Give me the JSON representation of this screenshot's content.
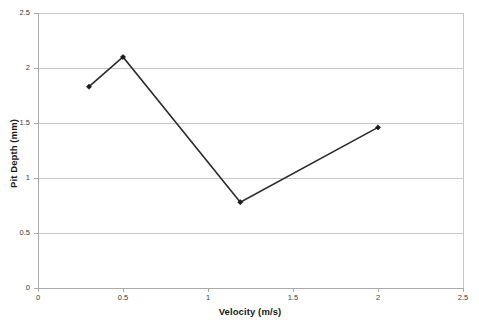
{
  "chart_data": {
    "type": "line",
    "title": "",
    "xlabel": "Velocity (m/s)",
    "ylabel": "Pit Depth (mm)",
    "xlim": [
      0,
      2.5
    ],
    "ylim": [
      0,
      2.5
    ],
    "xticks": [
      "0",
      "0.5",
      "1",
      "1.5",
      "2",
      "2.5"
    ],
    "xtick_values": [
      0,
      0.5,
      1,
      1.5,
      2,
      2.5
    ],
    "yticks": [
      "0",
      "0.5",
      "1",
      "1.5",
      "2",
      "2.5"
    ],
    "ytick_values": [
      0,
      0.5,
      1,
      1.5,
      2,
      2.5
    ],
    "grid": "horizontal",
    "legend": "none",
    "series": [
      {
        "name": "Pit Depth",
        "color": "#2b2b2b",
        "marker": "diamond",
        "x": [
          0.3,
          0.5,
          1.19,
          2.0
        ],
        "y": [
          1.83,
          2.1,
          0.78,
          1.46
        ],
        "points": [
          {
            "x": 0.3,
            "y": 1.83
          },
          {
            "x": 0.5,
            "y": 2.1
          },
          {
            "x": 1.19,
            "y": 0.78
          },
          {
            "x": 2.0,
            "y": 1.46
          }
        ]
      }
    ],
    "colors": {
      "line": "#2b2b2b",
      "marker": "#1a1a1a",
      "gridline": "#c8c8c8",
      "axis": "#aaaaaa",
      "background": "#ffffff",
      "tick_text": "#3a3a3a",
      "title_text": "#1a1a1a"
    }
  }
}
